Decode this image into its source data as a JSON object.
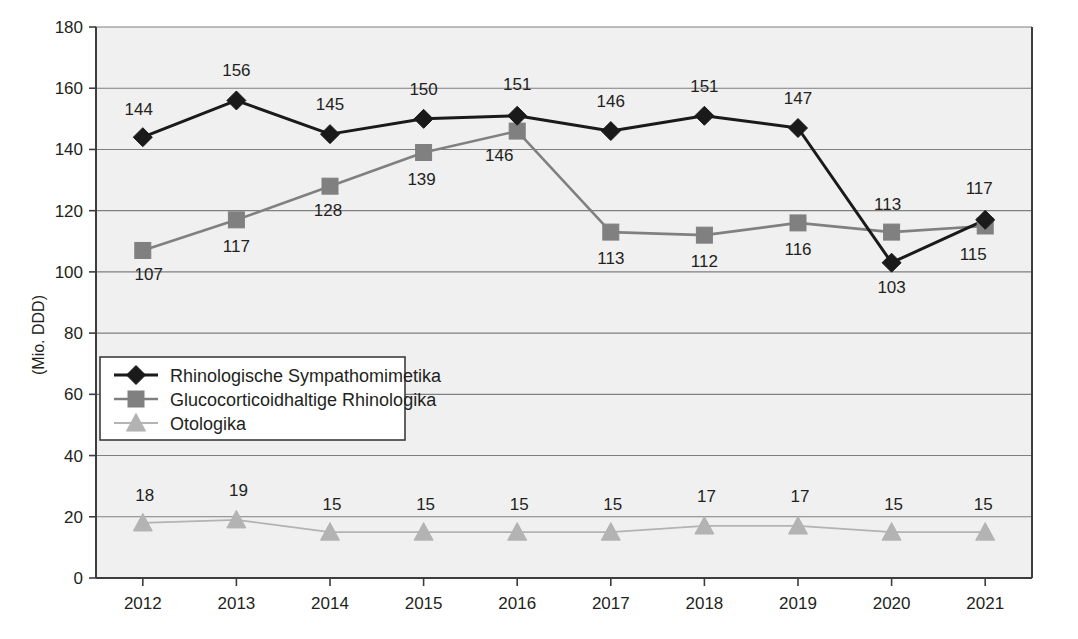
{
  "chart_data": {
    "type": "line",
    "title": "",
    "subtitle": "",
    "xlabel": "",
    "ylabel": "(Mio. DDD)",
    "categories": [
      "2012",
      "2013",
      "2014",
      "2015",
      "2016",
      "2017",
      "2018",
      "2019",
      "2020",
      "2021"
    ],
    "ylim": [
      0,
      180
    ],
    "ytick_step": 20,
    "yticks": [
      "0",
      "20",
      "40",
      "60",
      "80",
      "100",
      "120",
      "140",
      "160",
      "180"
    ],
    "grid": true,
    "legend_position": "inside-left-middle",
    "series": [
      {
        "name": "Rhinologische Sympathomimetika",
        "marker": "diamond",
        "color": "#1a1a1a",
        "values": [
          144,
          156,
          145,
          150,
          151,
          146,
          151,
          147,
          103,
          117
        ],
        "labels": [
          "144",
          "156",
          "145",
          "150",
          "151",
          "146",
          "151",
          "147",
          "103",
          "117"
        ]
      },
      {
        "name": "Glucocorticoidhaltige Rhinologika",
        "marker": "square",
        "color": "#808080",
        "values": [
          107,
          117,
          128,
          139,
          146,
          113,
          112,
          116,
          113,
          115
        ],
        "labels": [
          "107",
          "117",
          "128",
          "139",
          "146",
          "113",
          "112",
          "116",
          "113",
          "115"
        ]
      },
      {
        "name": "Otologika",
        "marker": "triangle",
        "color": "#b3b3b3",
        "values": [
          18,
          19,
          15,
          15,
          15,
          15,
          17,
          17,
          15,
          15
        ],
        "labels": [
          "18",
          "19",
          "15",
          "15",
          "15",
          "15",
          "17",
          "17",
          "15",
          "15"
        ]
      }
    ]
  },
  "colors": {
    "plot_background": "#f0f0f0",
    "gridline": "#7f7f7f",
    "axis": "#3d3d3d",
    "series_1": "#1a1a1a",
    "series_2": "#808080",
    "series_3": "#b3b3b3",
    "text": "#231f20"
  },
  "legend": {
    "items": [
      {
        "label": "Rhinologische Sympathomimetika"
      },
      {
        "label": "Glucocorticoidhaltige Rhinologika"
      },
      {
        "label": "Otologika"
      }
    ]
  },
  "axes": {
    "y_title": "(Mio. DDD)",
    "y_ticks": [
      "180",
      "160",
      "140",
      "120",
      "100",
      "80",
      "60",
      "40",
      "20",
      "0"
    ],
    "x_ticks": [
      "2012",
      "2013",
      "2014",
      "2015",
      "2016",
      "2017",
      "2018",
      "2019",
      "2020",
      "2021"
    ]
  },
  "data_labels": {
    "series_1": [
      "144",
      "156",
      "145",
      "150",
      "151",
      "146",
      "151",
      "147",
      "103",
      "117"
    ],
    "series_2": [
      "107",
      "117",
      "128",
      "139",
      "146",
      "113",
      "112",
      "116",
      "113",
      "115"
    ],
    "series_3": [
      "18",
      "19",
      "15",
      "15",
      "15",
      "15",
      "17",
      "17",
      "15",
      "15"
    ]
  }
}
